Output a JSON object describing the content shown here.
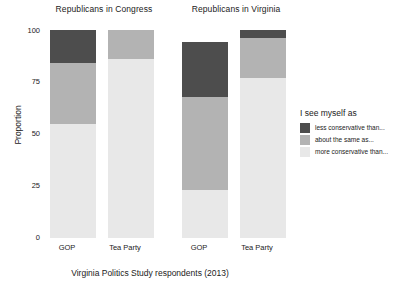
{
  "chart_data": {
    "type": "bar",
    "subtype": "stacked-proportion",
    "title": "",
    "xlabel": "Virginia Politics Study respondents (2013)",
    "ylabel": "Proportion",
    "ylim": [
      0,
      100
    ],
    "yticks": [
      0,
      25,
      50,
      75,
      100
    ],
    "ytick_labels": [
      "0",
      "25",
      "50",
      "75",
      "100"
    ],
    "grid": false,
    "legend_position": "right",
    "legend_title": "I see myself as",
    "panels": [
      {
        "title": "Republicans in Congress",
        "categories": [
          "GOP",
          "Tea Party"
        ],
        "series": [
          {
            "name": "less conservative than...",
            "color": "#4d4d4d",
            "values": [
              16,
              0
            ]
          },
          {
            "name": "about the same as...",
            "color": "#b3b3b3",
            "values": [
              29,
              14
            ]
          },
          {
            "name": "more conservative than...",
            "color": "#e8e8e8",
            "values": [
              55,
              86
            ]
          }
        ],
        "totals": [
          100,
          100
        ]
      },
      {
        "title": "Republicans in Virginia",
        "categories": [
          "GOP",
          "Tea Party"
        ],
        "series": [
          {
            "name": "less conservative than...",
            "color": "#4d4d4d",
            "values": [
              26,
              4
            ]
          },
          {
            "name": "about the same as...",
            "color": "#b3b3b3",
            "values": [
              45,
              19
            ]
          },
          {
            "name": "more conservative than...",
            "color": "#e8e8e8",
            "values": [
              23,
              77
            ]
          }
        ],
        "totals": [
          94,
          100
        ]
      }
    ]
  },
  "panels": {
    "congress": {
      "title": "Republicans in Congress",
      "cat_gop": "GOP",
      "cat_tea": "Tea Party"
    },
    "virginia": {
      "title": "Republicans in Virginia",
      "cat_gop": "GOP",
      "cat_tea": "Tea Party"
    }
  },
  "axis": {
    "ylabel": "Proportion",
    "xlabel": "Virginia Politics Study respondents (2013)",
    "tick_100": "100",
    "tick_75": "75",
    "tick_50": "50",
    "tick_25": "25",
    "tick_0": "0"
  },
  "legend": {
    "title": "I see myself as",
    "items": [
      {
        "label": "less conservative than...",
        "color": "#4d4d4d"
      },
      {
        "label": "about the same as...",
        "color": "#b3b3b3"
      },
      {
        "label": "more conservative than...",
        "color": "#e8e8e8"
      }
    ]
  }
}
